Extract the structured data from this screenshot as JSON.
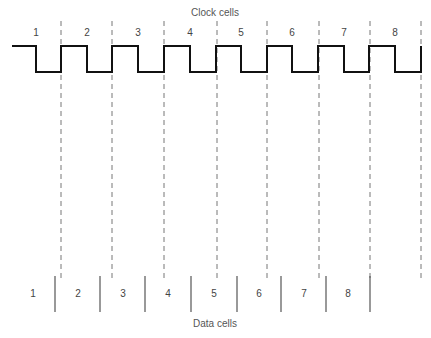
{
  "clock": {
    "title": "Clock cells",
    "cells": [
      "1",
      "2",
      "3",
      "4",
      "5",
      "6",
      "7",
      "8"
    ],
    "cell_label_x": [
      36,
      87,
      138,
      190,
      241,
      292,
      344,
      395
    ],
    "boundaries_x": [
      61,
      112,
      164,
      217,
      267,
      319,
      370,
      421
    ],
    "waveform_points": "12,46 36,46 36,72 61,72 61,46 87,46 87,72 112,72 112,46 138,46 138,72 164,72 164,46 190,46 190,72 216,72 216,46 241,46 241,72 267,72 267,46 292,46 292,72 318,72 318,46 344,46 344,72 369,72 369,46 395,46 395,72 421,72 421,46"
  },
  "data": {
    "title": "Data cells",
    "cells": [
      "1",
      "2",
      "3",
      "4",
      "5",
      "6",
      "7",
      "8"
    ],
    "cell_label_x": [
      33,
      78,
      123,
      168,
      214,
      259,
      304,
      348
    ],
    "separators_x": [
      55,
      100,
      145,
      191,
      237,
      281,
      326,
      370
    ]
  },
  "colors": {
    "wave": "#111111",
    "dashed": "#777777",
    "separator": "#555555"
  }
}
